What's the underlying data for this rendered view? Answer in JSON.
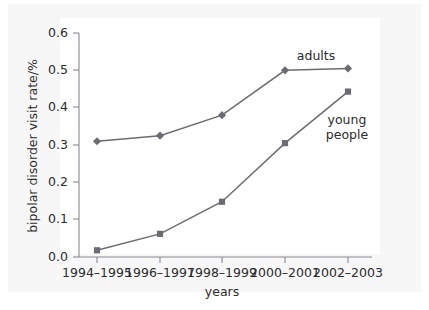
{
  "figure": {
    "background_color": "#ffffff",
    "panel_color": "#f7f7f8",
    "plot_background": "#ffffff"
  },
  "chart_data": {
    "type": "line",
    "title": "",
    "xlabel": "years",
    "ylabel": "bipolar disorder visit rate/%",
    "categories": [
      "1994–1995",
      "1996–1997",
      "1998–1999",
      "2000–2001",
      "2002–2003"
    ],
    "ylim": [
      0.0,
      0.6
    ],
    "yticks": [
      0.0,
      0.1,
      0.2,
      0.3,
      0.4,
      0.5,
      0.6
    ],
    "ytick_labels": [
      "0.0",
      "0.1",
      "0.2",
      "0.3",
      "0.4",
      "0.5",
      "0.6"
    ],
    "grid": false,
    "legend_position": "inline-annotations",
    "series": [
      {
        "name": "adults",
        "label": "adults",
        "marker": "diamond",
        "color": "#6b6b73",
        "values": [
          0.31,
          0.325,
          0.38,
          0.5,
          0.505
        ]
      },
      {
        "name": "young people",
        "label_line1": "young",
        "label_line2": "people",
        "marker": "square",
        "color": "#6b6b73",
        "values": [
          0.018,
          0.062,
          0.148,
          0.305,
          0.443
        ]
      }
    ],
    "annotations": [
      {
        "text": "adults",
        "series": "adults"
      },
      {
        "text": "young people",
        "series": "young people"
      }
    ]
  }
}
